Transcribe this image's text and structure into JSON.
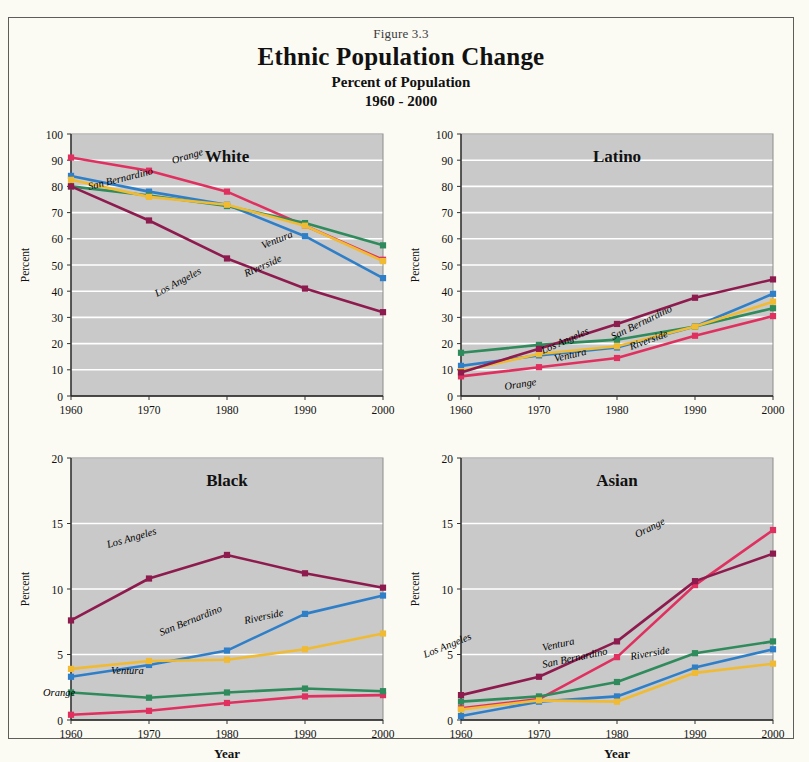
{
  "figure": {
    "number": "Figure 3.3",
    "title": "Ethnic Population Change",
    "subtitle1": "Percent of Population",
    "subtitle2": "1960 - 2000"
  },
  "colors": {
    "orange_county": "#e03060",
    "san_bernardino": "#2f7fc8",
    "ventura": "#2f8a5c",
    "riverside": "#f0bb33",
    "los_angeles": "#8e1b4e",
    "plot_background": "#c9c9c9",
    "gridline": "#ffffff",
    "page_background": "#fbfaf3",
    "border": "#5d5d5a",
    "text": "#111111"
  },
  "axis": {
    "xlabel": "Year",
    "ylabel": "Percent",
    "x_ticks": [
      "1960",
      "1970",
      "1980",
      "1990",
      "2000"
    ],
    "y_ticks_100": [
      "0",
      "10",
      "20",
      "30",
      "40",
      "50",
      "60",
      "70",
      "80",
      "90",
      "100"
    ],
    "y_ticks_20": [
      "0",
      "5",
      "10",
      "15",
      "20"
    ]
  },
  "series_names": {
    "orange_county": "Orange",
    "san_bernardino": "San Bernardino",
    "ventura": "Ventura",
    "riverside": "Riverside",
    "los_angeles": "Los Angeles"
  },
  "chart_data": [
    {
      "type": "line",
      "title": "White",
      "xlabel": "",
      "ylabel": "Percent",
      "x": [
        1960,
        1970,
        1980,
        1990,
        2000
      ],
      "xlim": [
        1960,
        2000
      ],
      "ylim": [
        0,
        100
      ],
      "ytick_step": 10,
      "grid": true,
      "legend": "inline-labels",
      "series": [
        {
          "name": "Orange",
          "color": "#e03060",
          "values": [
            91,
            86,
            78,
            65,
            52
          ]
        },
        {
          "name": "San Bernardino",
          "color": "#2f7fc8",
          "values": [
            84,
            78,
            73,
            61,
            45
          ]
        },
        {
          "name": "Ventura",
          "color": "#2f8a5c",
          "values": [
            80,
            76.5,
            72.5,
            66,
            57.5
          ]
        },
        {
          "name": "Riverside",
          "color": "#f0bb33",
          "values": [
            82.5,
            76,
            73,
            65,
            51.5
          ]
        },
        {
          "name": "Los Angeles",
          "color": "#8e1b4e",
          "values": [
            80,
            67,
            52.5,
            41,
            32
          ]
        }
      ]
    },
    {
      "type": "line",
      "title": "Latino",
      "xlabel": "",
      "ylabel": "Percent",
      "x": [
        1960,
        1970,
        1980,
        1990,
        2000
      ],
      "xlim": [
        1960,
        2000
      ],
      "ylim": [
        0,
        100
      ],
      "ytick_step": 10,
      "grid": true,
      "legend": "inline-labels",
      "series": [
        {
          "name": "Orange",
          "color": "#e03060",
          "values": [
            7.5,
            11,
            14.5,
            23,
            30.5
          ]
        },
        {
          "name": "San Bernardino",
          "color": "#2f7fc8",
          "values": [
            11.5,
            15.5,
            18.5,
            26.5,
            39
          ]
        },
        {
          "name": "Ventura",
          "color": "#2f8a5c",
          "values": [
            16.5,
            19.5,
            21.5,
            26.5,
            33.5
          ]
        },
        {
          "name": "Riverside",
          "color": "#f0bb33",
          "values": [
            9.5,
            16,
            19,
            26.5,
            36
          ]
        },
        {
          "name": "Los Angeles",
          "color": "#8e1b4e",
          "values": [
            9,
            18,
            27.5,
            37.5,
            44.5
          ]
        }
      ]
    },
    {
      "type": "line",
      "title": "Black",
      "xlabel": "Year",
      "ylabel": "Percent",
      "x": [
        1960,
        1970,
        1980,
        1990,
        2000
      ],
      "xlim": [
        1960,
        2000
      ],
      "ylim": [
        0,
        20
      ],
      "ytick_step": 5,
      "grid": true,
      "legend": "inline-labels",
      "series": [
        {
          "name": "Orange",
          "color": "#e03060",
          "values": [
            0.4,
            0.7,
            1.3,
            1.8,
            1.9
          ]
        },
        {
          "name": "San Bernardino",
          "color": "#2f7fc8",
          "values": [
            3.3,
            4.2,
            5.3,
            8.1,
            9.5
          ]
        },
        {
          "name": "Ventura",
          "color": "#2f8a5c",
          "values": [
            2.1,
            1.7,
            2.1,
            2.4,
            2.2
          ]
        },
        {
          "name": "Riverside",
          "color": "#f0bb33",
          "values": [
            3.9,
            4.5,
            4.6,
            5.4,
            6.6
          ]
        },
        {
          "name": "Los Angeles",
          "color": "#8e1b4e",
          "values": [
            7.6,
            10.8,
            12.6,
            11.2,
            10.1
          ]
        }
      ]
    },
    {
      "type": "line",
      "title": "Asian",
      "xlabel": "Year",
      "ylabel": "Percent",
      "x": [
        1960,
        1970,
        1980,
        1990,
        2000
      ],
      "xlim": [
        1960,
        2000
      ],
      "ylim": [
        0,
        20
      ],
      "ytick_step": 5,
      "grid": true,
      "legend": "inline-labels",
      "series": [
        {
          "name": "Orange",
          "color": "#e03060",
          "values": [
            0.9,
            1.6,
            4.8,
            10.3,
            14.5
          ]
        },
        {
          "name": "San Bernardino",
          "color": "#2f7fc8",
          "values": [
            0.3,
            1.4,
            1.8,
            4.0,
            5.4
          ]
        },
        {
          "name": "Ventura",
          "color": "#2f8a5c",
          "values": [
            1.4,
            1.8,
            2.9,
            5.1,
            6.0
          ]
        },
        {
          "name": "Riverside",
          "color": "#f0bb33",
          "values": [
            0.8,
            1.5,
            1.4,
            3.6,
            4.3
          ]
        },
        {
          "name": "Los Angeles",
          "color": "#8e1b4e",
          "values": [
            1.9,
            3.3,
            6.0,
            10.6,
            12.7
          ]
        }
      ]
    }
  ],
  "annotations": [
    {
      "panel": 0,
      "text": "Orange",
      "x": 160,
      "y": 42,
      "rot": -17
    },
    {
      "panel": 0,
      "text": "San Bernardino",
      "x": 76,
      "y": 68,
      "rot": -14
    },
    {
      "panel": 0,
      "text": "Ventura",
      "x": 250,
      "y": 127,
      "rot": -22
    },
    {
      "panel": 0,
      "text": "Riverside",
      "x": 233,
      "y": 155,
      "rot": -24
    },
    {
      "panel": 0,
      "text": "Los Angeles",
      "x": 144,
      "y": 175,
      "rot": -28
    },
    {
      "panel": 1,
      "text": "Orange",
      "x": 102,
      "y": 268,
      "rot": -9
    },
    {
      "panel": 1,
      "text": "San Bernardino",
      "x": 210,
      "y": 218,
      "rot": -26
    },
    {
      "panel": 1,
      "text": "Ventura",
      "x": 152,
      "y": 240,
      "rot": -13
    },
    {
      "panel": 1,
      "text": "Riverside",
      "x": 228,
      "y": 228,
      "rot": -20
    },
    {
      "panel": 1,
      "text": "Los Angeles",
      "x": 140,
      "y": 232,
      "rot": -24
    },
    {
      "panel": 2,
      "text": "Orange",
      "x": 30,
      "y": 250,
      "rot": 0
    },
    {
      "panel": 2,
      "text": "San Bernardino",
      "x": 148,
      "y": 190,
      "rot": -22
    },
    {
      "panel": 2,
      "text": "Ventura",
      "x": 98,
      "y": 228,
      "rot": 0
    },
    {
      "panel": 2,
      "text": "Riverside",
      "x": 232,
      "y": 178,
      "rot": -12
    },
    {
      "panel": 2,
      "text": "Los Angeles",
      "x": 95,
      "y": 102,
      "rot": -16
    },
    {
      "panel": 3,
      "text": "Orange",
      "x": 234,
      "y": 92,
      "rot": -27
    },
    {
      "panel": 3,
      "text": "San Bernardino",
      "x": 140,
      "y": 222,
      "rot": -12
    },
    {
      "panel": 3,
      "text": "Ventura",
      "x": 140,
      "y": 205,
      "rot": -12
    },
    {
      "panel": 3,
      "text": "Riverside",
      "x": 228,
      "y": 214,
      "rot": -10
    },
    {
      "panel": 3,
      "text": "Los Angeles",
      "x": 22,
      "y": 212,
      "rot": -22
    }
  ]
}
